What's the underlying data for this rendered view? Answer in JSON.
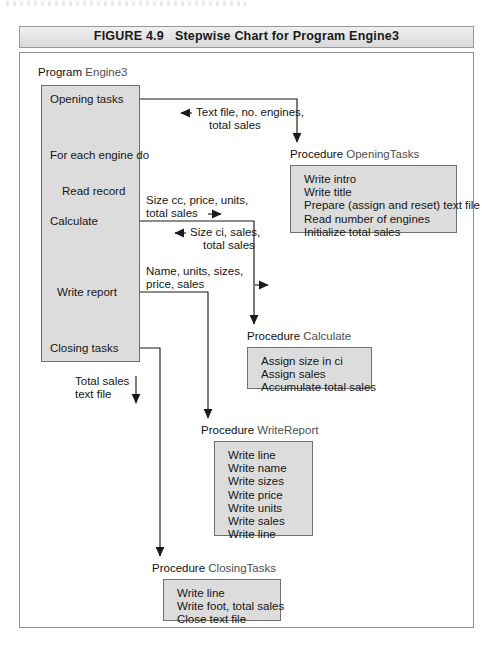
{
  "caption": {
    "figure_number": "FIGURE 4.9",
    "title": "Stepwise Chart for Program Engine3"
  },
  "program": {
    "keyword": "Program",
    "name": "Engine3",
    "steps": [
      "Opening tasks",
      "For each engine do",
      "Read record",
      "Calculate",
      "Write report",
      "Closing tasks"
    ]
  },
  "annotations": [
    {
      "id": "opening-return",
      "lines": [
        "Text file, no. engines,",
        "total sales"
      ],
      "arrow": "left"
    },
    {
      "id": "calculate-send",
      "lines": [
        "Size cc, price, units,",
        "total sales"
      ],
      "arrow": "right"
    },
    {
      "id": "calculate-return",
      "lines": [
        "Size ci, sales,",
        "total sales"
      ],
      "arrow": "left"
    },
    {
      "id": "writereport-send",
      "lines": [
        "Name, units, sizes,",
        "price, sales"
      ],
      "arrow": "right"
    },
    {
      "id": "closing-send",
      "lines": [
        "Total sales",
        "text file"
      ],
      "arrow": "down"
    }
  ],
  "procedures": [
    {
      "keyword": "Procedure",
      "name": "OpeningTasks",
      "statements": [
        "Write intro",
        "Write title",
        "Prepare (assign and reset) text file",
        "Read number of engines",
        "Initialize total sales"
      ]
    },
    {
      "keyword": "Procedure",
      "name": "Calculate",
      "statements": [
        "Assign size in ci",
        "Assign sales",
        "Accumulate total sales"
      ]
    },
    {
      "keyword": "Procedure",
      "name": "WriteReport",
      "statements": [
        "Write line",
        "Write name",
        "Write sizes",
        "Write price",
        "Write units",
        "Write sales",
        "Write line"
      ]
    },
    {
      "keyword": "Procedure",
      "name": "ClosingTasks",
      "statements": [
        "Write line",
        "Write foot, total sales",
        "Close text file"
      ]
    }
  ],
  "colors": {
    "panel_fill": "#dcdcdc",
    "panel_border": "#6f6f6f",
    "caption_bar": "#e3e3e3",
    "frame_border": "#8e8e8e",
    "text": "#161616",
    "name_text": "#4e4e4e"
  }
}
